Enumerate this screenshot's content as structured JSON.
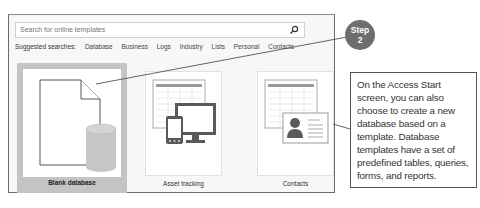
{
  "search": {
    "placeholder": "Search for online templates",
    "icon": "search-icon"
  },
  "suggested": {
    "label": "Suggested searches:",
    "items": [
      "Database",
      "Business",
      "Logs",
      "Industry",
      "Lists",
      "Personal",
      "Contacts"
    ]
  },
  "templates": [
    {
      "label": "Blank database",
      "icon": "blank-database-icon",
      "selected": true
    },
    {
      "label": "Asset tracking",
      "icon": "asset-tracking-icon",
      "selected": false
    },
    {
      "label": "Contacts",
      "icon": "contacts-icon",
      "selected": false
    }
  ],
  "step": {
    "line1": "Step",
    "line2": "2",
    "color": "#6e6e6e"
  },
  "callout": {
    "text": "On the Access Start screen, you can also choose to create a new database based on a template. Database templates have a set of predefined tables, queries, forms, and reports."
  }
}
